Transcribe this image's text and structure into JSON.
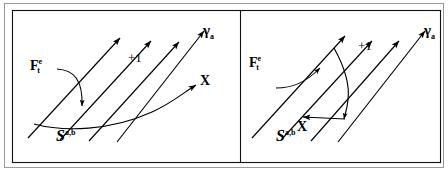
{
  "figure": {
    "background_color": "#ffffff",
    "stroke_color": "#000000",
    "frame": {
      "outer_border_color": "#8a8a8a",
      "inner_border_color": "#000000",
      "divider_color": "#000000"
    },
    "panels": [
      {
        "id": "left-panel",
        "name": "left-diagram-panel",
        "labels": {
          "force": {
            "base": "F",
            "superscript": "e",
            "subscript": "t"
          },
          "gamma": {
            "base": "γ",
            "subscript": "a"
          },
          "surface": {
            "base": "S",
            "superscript": "a,b"
          },
          "axis": "X",
          "increment": "+1"
        }
      },
      {
        "id": "right-panel",
        "name": "right-diagram-panel",
        "labels": {
          "force": {
            "base": "F",
            "superscript": "e",
            "subscript": "t"
          },
          "gamma": {
            "base": "γ",
            "subscript": "a"
          },
          "surface": {
            "base": "S",
            "superscript": "a,b"
          },
          "axis": "X",
          "increment": "+1"
        }
      }
    ],
    "geometry": {
      "parallel_field_lines": 4,
      "field_line_direction": "up-right",
      "left_panel_curve": "monotone-rising-curve-crossing-field-lines",
      "right_panel_curve": "descending-curve-to-horizontal-leftward-arrow"
    }
  }
}
